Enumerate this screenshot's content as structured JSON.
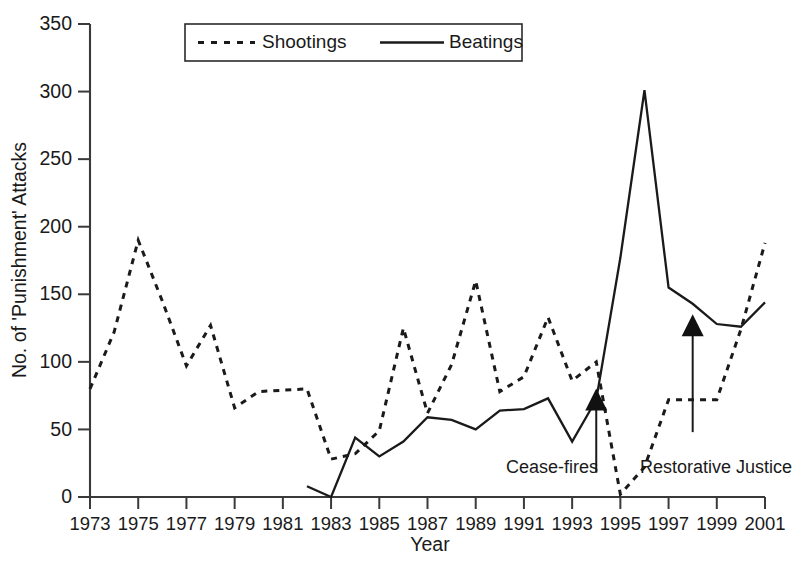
{
  "chart_data": {
    "type": "line",
    "title": "",
    "xlabel": "Year",
    "ylabel": "No. of 'Punishment' Attacks",
    "xlim": [
      1973,
      2001
    ],
    "ylim": [
      0,
      350
    ],
    "grid": false,
    "legend_position": "top-center",
    "y_ticks": [
      0,
      50,
      100,
      150,
      200,
      250,
      300,
      350
    ],
    "x_ticks": [
      1973,
      1975,
      1977,
      1979,
      1981,
      1983,
      1985,
      1987,
      1989,
      1991,
      1993,
      1995,
      1997,
      1999,
      2001
    ],
    "x_tick_labels": [
      "1973",
      "1975",
      "1977",
      "1979",
      "1981",
      "1983",
      "1985",
      "1987",
      "1989",
      "1991",
      "1993",
      "1995",
      "1997",
      "1999",
      "2001"
    ],
    "y_tick_labels": [
      "0",
      "50",
      "100",
      "150",
      "200",
      "250",
      "300",
      "350"
    ],
    "series": [
      {
        "name": "Shootings",
        "style": "dotted",
        "color": "#1a1a1a",
        "x": [
          1973,
          1974,
          1975,
          1976,
          1977,
          1978,
          1979,
          1980,
          1981,
          1982,
          1983,
          1984,
          1985,
          1986,
          1987,
          1988,
          1989,
          1990,
          1991,
          1992,
          1993,
          1994,
          1995,
          1996,
          1997,
          1998,
          1999,
          2000,
          2001
        ],
        "values": [
          80,
          122,
          190,
          145,
          97,
          127,
          66,
          78,
          79,
          80,
          28,
          32,
          49,
          125,
          62,
          98,
          160,
          78,
          89,
          133,
          86,
          100,
          2,
          22,
          72,
          72,
          72,
          124,
          188
        ]
      },
      {
        "name": "Beatings",
        "style": "solid",
        "color": "#1a1a1a",
        "x": [
          1982,
          1983,
          1984,
          1985,
          1986,
          1987,
          1988,
          1989,
          1990,
          1991,
          1992,
          1993,
          1994,
          1995,
          1996,
          1997,
          1998,
          1999,
          2000,
          2001
        ],
        "values": [
          8,
          0,
          44,
          30,
          41,
          59,
          57,
          50,
          64,
          65,
          73,
          41,
          72,
          177,
          301,
          155,
          143,
          128,
          126,
          144
        ]
      }
    ],
    "annotations": [
      {
        "label": "Cease-fires",
        "x_year": 1994,
        "arrow_to_value": 78,
        "arrow_from_value": 18
      },
      {
        "label": "Restorative Justice",
        "x_year": 1998,
        "arrow_to_value": 133,
        "arrow_from_value": 48
      }
    ]
  },
  "legend": {
    "entries": [
      {
        "label": "Shootings",
        "style": "dotted"
      },
      {
        "label": "Beatings",
        "style": "solid"
      }
    ]
  },
  "axes": {
    "x_title": "Year",
    "y_title": "No. of 'Punishment' Attacks"
  }
}
